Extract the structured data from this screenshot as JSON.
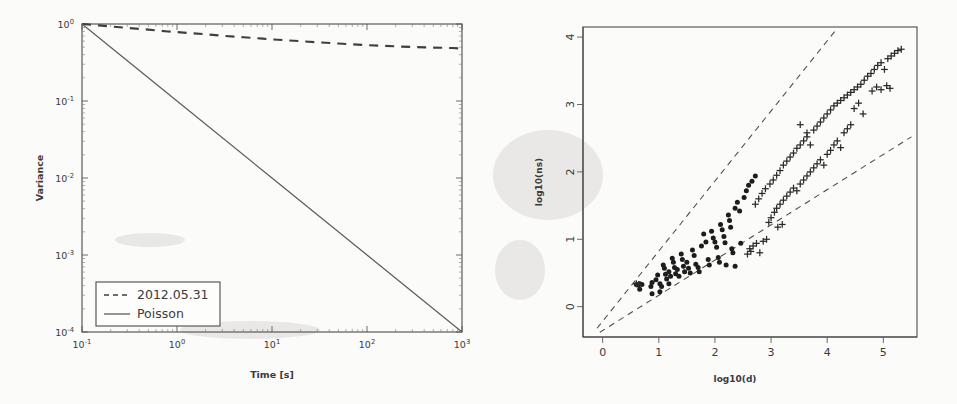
{
  "figure": {
    "background_color": "#fbfbfa",
    "ink_color": "#3a3a3a"
  },
  "chart_data": [
    {
      "id": "variance-vs-time",
      "type": "line",
      "title": "",
      "xlabel": "Time [s]",
      "ylabel": "Variance",
      "xscale": "log",
      "yscale": "log",
      "xlim": [
        0.1,
        1000
      ],
      "ylim": [
        0.0001,
        1
      ],
      "xticklabels": [
        "10-1",
        "100",
        "101",
        "102",
        "103"
      ],
      "xtick_bases": [
        "10",
        "10",
        "10",
        "10",
        "10"
      ],
      "xtick_exponents": [
        "-1",
        "0",
        "1",
        "2",
        "3"
      ],
      "yticklabels": [
        "100",
        "10-1",
        "10-2",
        "10-3",
        "10-4"
      ],
      "ytick_bases": [
        "10",
        "10",
        "10",
        "10",
        "10"
      ],
      "ytick_exponents": [
        "0",
        "-1",
        "-2",
        "-3",
        "-4"
      ],
      "grid": false,
      "legend_position": "lower left",
      "series": [
        {
          "name": "2012.05.31",
          "style": "dashed",
          "x": [
            0.1,
            0.15,
            0.2,
            0.3,
            0.5,
            0.8,
            1,
            2,
            3,
            5,
            8,
            10,
            20,
            30,
            50,
            80,
            100,
            200,
            300,
            500,
            800,
            1000
          ],
          "y": [
            1.0,
            0.96,
            0.93,
            0.89,
            0.845,
            0.8,
            0.785,
            0.735,
            0.705,
            0.672,
            0.645,
            0.632,
            0.598,
            0.578,
            0.558,
            0.54,
            0.532,
            0.512,
            0.503,
            0.494,
            0.487,
            0.478
          ]
        },
        {
          "name": "Poisson",
          "style": "solid",
          "x": [
            0.1,
            1,
            10,
            100,
            1000
          ],
          "y": [
            1.0,
            0.1,
            0.01,
            0.001,
            0.0001
          ]
        }
      ]
    },
    {
      "id": "log-ns-vs-log-d",
      "type": "scatter",
      "title": "",
      "xlabel": "log10(d)",
      "ylabel": "log10(ns)",
      "xscale": "linear",
      "yscale": "linear",
      "xlim": [
        -0.35,
        5.6
      ],
      "ylim": [
        -0.45,
        4.15
      ],
      "xticklabels": [
        "0",
        "1",
        "2",
        "3",
        "4",
        "5"
      ],
      "xticks": [
        0,
        1,
        2,
        3,
        4,
        5
      ],
      "yticklabels": [
        "0",
        "1",
        "2",
        "3",
        "4"
      ],
      "yticks": [
        0,
        1,
        2,
        3,
        4
      ],
      "grid": false,
      "legend_position": "none",
      "reference_lines": [
        {
          "name": "upper-guide",
          "style": "dashed",
          "x": [
            -0.1,
            4.15
          ],
          "y": [
            -0.32,
            4.1
          ]
        },
        {
          "name": "lower-guide",
          "style": "dashed",
          "x": [
            -0.05,
            5.5
          ],
          "y": [
            -0.38,
            2.52
          ]
        }
      ],
      "series": [
        {
          "name": "dots",
          "marker": "filled-circle",
          "points": [
            [
              0.6,
              0.33
            ],
            [
              0.63,
              0.32
            ],
            [
              0.66,
              0.34
            ],
            [
              0.7,
              0.33
            ],
            [
              0.66,
              0.26
            ],
            [
              0.86,
              0.3
            ],
            [
              0.88,
              0.19
            ],
            [
              0.95,
              0.4
            ],
            [
              0.98,
              0.47
            ],
            [
              1.02,
              0.34
            ],
            [
              1.05,
              0.3
            ],
            [
              1.08,
              0.62
            ],
            [
              1.1,
              0.57
            ],
            [
              1.12,
              0.48
            ],
            [
              1.14,
              0.41
            ],
            [
              1.18,
              0.52
            ],
            [
              1.21,
              0.45
            ],
            [
              1.24,
              0.72
            ],
            [
              1.26,
              0.66
            ],
            [
              1.28,
              0.58
            ],
            [
              1.3,
              0.49
            ],
            [
              1.33,
              0.55
            ],
            [
              1.36,
              0.45
            ],
            [
              1.4,
              0.78
            ],
            [
              1.42,
              0.7
            ],
            [
              1.44,
              0.6
            ],
            [
              1.46,
              0.52
            ],
            [
              1.5,
              0.66
            ],
            [
              1.53,
              0.57
            ],
            [
              1.56,
              0.5
            ],
            [
              1.6,
              0.84
            ],
            [
              1.63,
              0.76
            ],
            [
              1.66,
              0.63
            ],
            [
              1.7,
              0.58
            ],
            [
              1.72,
              0.52
            ],
            [
              1.76,
              0.9
            ],
            [
              1.8,
              1.08
            ],
            [
              1.84,
              0.96
            ],
            [
              1.88,
              0.7
            ],
            [
              1.9,
              0.62
            ],
            [
              1.94,
              1.12
            ],
            [
              1.97,
              1.02
            ],
            [
              2.0,
              0.96
            ],
            [
              2.03,
              0.88
            ],
            [
              2.06,
              0.73
            ],
            [
              2.08,
              0.66
            ],
            [
              2.1,
              1.22
            ],
            [
              2.13,
              1.14
            ],
            [
              2.16,
              1.04
            ],
            [
              2.18,
              0.95
            ],
            [
              2.2,
              0.62
            ],
            [
              2.24,
              1.36
            ],
            [
              2.26,
              1.28
            ],
            [
              2.28,
              1.18
            ],
            [
              2.3,
              0.86
            ],
            [
              2.32,
              0.8
            ],
            [
              2.36,
              1.46
            ],
            [
              2.4,
              1.55
            ],
            [
              2.44,
              1.42
            ],
            [
              2.46,
              0.94
            ],
            [
              2.52,
              1.62
            ],
            [
              2.56,
              1.72
            ],
            [
              2.6,
              1.8
            ],
            [
              2.36,
              0.6
            ],
            [
              1.18,
              0.34
            ],
            [
              1.02,
              0.22
            ],
            [
              0.88,
              0.36
            ],
            [
              2.66,
              1.86
            ],
            [
              2.72,
              1.94
            ]
          ]
        },
        {
          "name": "plus-markers",
          "marker": "plus",
          "points": [
            [
              0.6,
              0.34
            ],
            [
              0.64,
              0.33
            ],
            [
              2.62,
              0.86
            ],
            [
              2.68,
              0.9
            ],
            [
              2.74,
              0.94
            ],
            [
              2.8,
              0.8
            ],
            [
              2.86,
              0.97
            ],
            [
              2.92,
              1.0
            ],
            [
              2.72,
              1.52
            ],
            [
              2.78,
              1.6
            ],
            [
              2.84,
              1.68
            ],
            [
              2.9,
              1.75
            ],
            [
              2.96,
              1.25
            ],
            [
              3.0,
              1.32
            ],
            [
              3.06,
              1.4
            ],
            [
              3.1,
              1.46
            ],
            [
              3.16,
              1.52
            ],
            [
              2.98,
              1.82
            ],
            [
              3.04,
              1.88
            ],
            [
              3.1,
              1.95
            ],
            [
              3.16,
              2.02
            ],
            [
              3.22,
              2.1
            ],
            [
              3.22,
              1.58
            ],
            [
              3.28,
              1.64
            ],
            [
              3.34,
              1.7
            ],
            [
              3.4,
              1.76
            ],
            [
              3.46,
              1.72
            ],
            [
              3.28,
              2.16
            ],
            [
              3.34,
              2.22
            ],
            [
              3.4,
              2.28
            ],
            [
              3.46,
              2.35
            ],
            [
              3.52,
              2.4
            ],
            [
              3.52,
              1.82
            ],
            [
              3.58,
              1.88
            ],
            [
              3.64,
              1.94
            ],
            [
              3.7,
              2.0
            ],
            [
              3.76,
              2.06
            ],
            [
              3.58,
              2.46
            ],
            [
              3.64,
              2.52
            ],
            [
              3.7,
              2.4
            ],
            [
              3.76,
              2.62
            ],
            [
              3.82,
              2.68
            ],
            [
              3.82,
              2.12
            ],
            [
              3.88,
              2.18
            ],
            [
              3.94,
              2.1
            ],
            [
              4.0,
              2.26
            ],
            [
              4.06,
              2.32
            ],
            [
              3.88,
              2.74
            ],
            [
              3.94,
              2.8
            ],
            [
              4.0,
              2.86
            ],
            [
              4.06,
              2.92
            ],
            [
              4.12,
              2.98
            ],
            [
              4.12,
              2.4
            ],
            [
              4.18,
              2.46
            ],
            [
              4.24,
              2.36
            ],
            [
              4.3,
              2.58
            ],
            [
              4.18,
              3.02
            ],
            [
              4.24,
              3.06
            ],
            [
              4.3,
              3.1
            ],
            [
              4.36,
              3.14
            ],
            [
              4.42,
              3.18
            ],
            [
              4.36,
              2.64
            ],
            [
              4.42,
              2.7
            ],
            [
              4.48,
              3.22
            ],
            [
              4.54,
              3.26
            ],
            [
              4.6,
              3.3
            ],
            [
              4.66,
              3.36
            ],
            [
              4.72,
              3.42
            ],
            [
              4.48,
              2.94
            ],
            [
              4.56,
              3.02
            ],
            [
              4.64,
              2.86
            ],
            [
              4.78,
              3.46
            ],
            [
              4.84,
              3.52
            ],
            [
              4.9,
              3.58
            ],
            [
              4.96,
              3.62
            ],
            [
              5.02,
              3.52
            ],
            [
              4.8,
              3.2
            ],
            [
              4.88,
              3.26
            ],
            [
              4.96,
              3.22
            ],
            [
              5.08,
              3.68
            ],
            [
              5.14,
              3.72
            ],
            [
              5.2,
              3.76
            ],
            [
              5.26,
              3.8
            ],
            [
              5.32,
              3.82
            ],
            [
              5.06,
              3.28
            ],
            [
              5.12,
              3.24
            ],
            [
              3.12,
              1.18
            ],
            [
              3.2,
              1.22
            ],
            [
              2.58,
              0.78
            ],
            [
              2.64,
              0.82
            ],
            [
              3.52,
              2.7
            ],
            [
              3.64,
              2.58
            ]
          ]
        }
      ]
    }
  ],
  "left_chart": {
    "legend": {
      "entries": [
        {
          "label": "2012.05.31",
          "style": "dashed"
        },
        {
          "label": "Poisson",
          "style": "solid"
        }
      ]
    },
    "axis_x_label": "Time [s]",
    "axis_y_label": "Variance"
  },
  "right_chart": {
    "axis_x_label": "log10(d)",
    "axis_y_label": "log10(ns)"
  }
}
